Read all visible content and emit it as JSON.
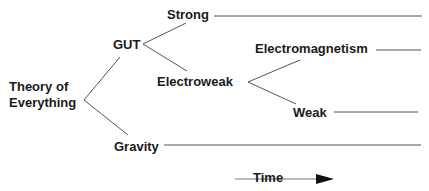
{
  "diagram": {
    "nodes": {
      "toe_line1": "Theory of",
      "toe_line2": "Everything",
      "gut": "GUT",
      "strong": "Strong",
      "electroweak": "Electroweak",
      "electromagnetism": "Electromagnetism",
      "weak": "Weak",
      "gravity": "Gravity"
    },
    "axis": {
      "label": "Time",
      "direction": "right-arrow"
    },
    "edges": [
      {
        "from": "Theory of Everything",
        "to": "GUT"
      },
      {
        "from": "Theory of Everything",
        "to": "Gravity"
      },
      {
        "from": "GUT",
        "to": "Strong"
      },
      {
        "from": "GUT",
        "to": "Electroweak"
      },
      {
        "from": "Electroweak",
        "to": "Electromagnetism"
      },
      {
        "from": "Electroweak",
        "to": "Weak"
      }
    ],
    "colors": {
      "text": "#1a1a1a",
      "line": "#555555",
      "arrow": "#111111"
    }
  }
}
